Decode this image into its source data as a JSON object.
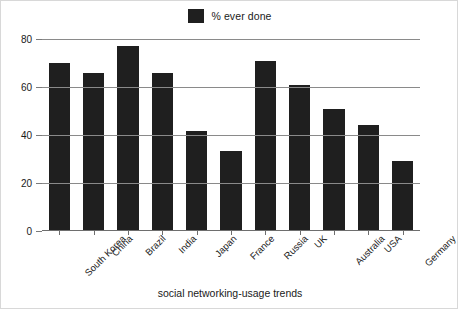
{
  "legend": {
    "label": "% ever done",
    "swatch_color": "#1f1f1f",
    "position": "top-center"
  },
  "chart_data": {
    "type": "bar",
    "title": "",
    "subtitle": "",
    "xlabel": "social networking-usage trends",
    "ylabel": "",
    "ylim": [
      0,
      80
    ],
    "yticks": [
      0,
      20,
      40,
      60,
      80
    ],
    "grid": true,
    "legend_position": "top-center",
    "series_name": "% ever done",
    "bar_color": "#1f1f1f",
    "categories": [
      "South Korea",
      "China",
      "Brazil",
      "India",
      "Japan",
      "France",
      "Russia",
      "UK",
      "Australia",
      "USA",
      "Germany"
    ],
    "values": [
      70,
      66,
      77,
      66,
      41.5,
      33.5,
      71,
      61,
      51,
      44,
      29
    ]
  },
  "axis": {
    "ytick_labels": [
      "80",
      "60",
      "40",
      "20",
      "0"
    ],
    "x_title": "social networking-usage trends"
  }
}
